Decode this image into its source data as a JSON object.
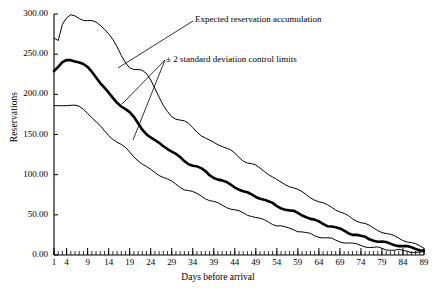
{
  "chart_data": {
    "type": "line",
    "title": "",
    "xlabel": "Days before arrival",
    "ylabel": "Reservations",
    "xlim": [
      1,
      89
    ],
    "ylim": [
      0,
      300
    ],
    "ytick_labels": [
      "0.00",
      "50.00",
      "100.00",
      "150.00",
      "200.00",
      "250.00",
      "300.00"
    ],
    "ytick_values": [
      0,
      50,
      100,
      150,
      200,
      250,
      300
    ],
    "xtick_labels": [
      "1",
      "4",
      "9",
      "14",
      "19",
      "24",
      "29",
      "34",
      "39",
      "44",
      "49",
      "54",
      "59",
      "64",
      "69",
      "74",
      "79",
      "84",
      "89"
    ],
    "xtick_values": [
      1,
      4,
      9,
      14,
      19,
      24,
      29,
      34,
      39,
      44,
      49,
      54,
      59,
      64,
      69,
      74,
      79,
      84,
      89
    ],
    "minor_xtick_interval": 1,
    "grid": false,
    "legend": "none",
    "line_color": "#000000",
    "background_color": "#ffffff",
    "annotations": [
      {
        "name": "expected-curve-label",
        "text": "Expected reservation accumulation"
      },
      {
        "name": "control-limits-label",
        "text": "± 2 standard deviation control limits"
      }
    ],
    "series": [
      {
        "name": "Upper control limit (+2 SD)",
        "style": "thin",
        "x": [
          1,
          2,
          3,
          4,
          5,
          6,
          7,
          8,
          9,
          10,
          11,
          12,
          13,
          14,
          15,
          16,
          17,
          18,
          19,
          20,
          21,
          22,
          23,
          24,
          25,
          26,
          27,
          28,
          29,
          30,
          31,
          32,
          33,
          34,
          35,
          36,
          37,
          38,
          39,
          40,
          41,
          42,
          43,
          44,
          45,
          46,
          47,
          48,
          49,
          50,
          51,
          52,
          53,
          54,
          55,
          56,
          57,
          58,
          59,
          60,
          61,
          62,
          63,
          64,
          65,
          66,
          67,
          68,
          69,
          70,
          71,
          72,
          73,
          74,
          75,
          76,
          77,
          78,
          79,
          80,
          81,
          82,
          83,
          84,
          85,
          86,
          87,
          88,
          89
        ],
        "y": [
          270,
          268,
          288,
          295,
          298,
          297,
          295,
          293,
          292,
          291,
          289,
          286,
          282,
          276,
          268,
          258,
          248,
          240,
          234,
          231,
          230,
          229,
          226,
          219,
          208,
          196,
          185,
          178,
          173,
          170,
          168,
          166,
          163,
          159,
          154,
          149,
          145,
          142,
          140,
          138,
          136,
          133,
          130,
          126,
          122,
          118,
          115,
          113,
          111,
          108,
          105,
          101,
          97,
          93,
          90,
          88,
          86,
          84,
          81,
          78,
          75,
          72,
          69,
          66,
          64,
          62,
          60,
          57,
          54,
          51,
          48,
          45,
          43,
          41,
          39,
          36,
          33,
          31,
          29,
          27,
          25,
          23,
          21,
          19,
          17,
          15,
          13,
          11,
          9
        ]
      },
      {
        "name": "Expected reservation accumulation",
        "style": "bold",
        "x": [
          1,
          2,
          3,
          4,
          5,
          6,
          7,
          8,
          9,
          10,
          11,
          12,
          13,
          14,
          15,
          16,
          17,
          18,
          19,
          20,
          21,
          22,
          23,
          24,
          25,
          26,
          27,
          28,
          29,
          30,
          31,
          32,
          33,
          34,
          35,
          36,
          37,
          38,
          39,
          40,
          41,
          42,
          43,
          44,
          45,
          46,
          47,
          48,
          49,
          50,
          51,
          52,
          53,
          54,
          55,
          56,
          57,
          58,
          59,
          60,
          61,
          62,
          63,
          64,
          65,
          66,
          67,
          68,
          69,
          70,
          71,
          72,
          73,
          74,
          75,
          76,
          77,
          78,
          79,
          80,
          81,
          82,
          83,
          84,
          85,
          86,
          87,
          88,
          89
        ],
        "y": [
          230,
          234,
          239,
          242,
          243,
          242,
          240,
          237,
          233,
          228,
          222,
          215,
          208,
          201,
          195,
          190,
          186,
          182,
          177,
          171,
          164,
          157,
          151,
          146,
          142,
          139,
          136,
          133,
          129,
          125,
          121,
          117,
          114,
          112,
          110,
          107,
          104,
          100,
          97,
          94,
          92,
          90,
          88,
          85,
          82,
          79,
          77,
          75,
          73,
          71,
          69,
          66,
          64,
          61,
          59,
          57,
          55,
          54,
          52,
          50,
          48,
          45,
          43,
          41,
          39,
          37,
          36,
          34,
          32,
          30,
          28,
          26,
          25,
          23,
          22,
          20,
          19,
          17,
          16,
          15,
          14,
          13,
          12,
          11,
          10,
          9,
          8,
          7,
          6
        ]
      },
      {
        "name": "Lower control limit (-2 SD)",
        "style": "thin",
        "x": [
          1,
          2,
          3,
          4,
          5,
          6,
          7,
          8,
          9,
          10,
          11,
          12,
          13,
          14,
          15,
          16,
          17,
          18,
          19,
          20,
          21,
          22,
          23,
          24,
          25,
          26,
          27,
          28,
          29,
          30,
          31,
          32,
          33,
          34,
          35,
          36,
          37,
          38,
          39,
          40,
          41,
          42,
          43,
          44,
          45,
          46,
          47,
          48,
          49,
          50,
          51,
          52,
          53,
          54,
          55,
          56,
          57,
          58,
          59,
          60,
          61,
          62,
          63,
          64,
          65,
          66,
          67,
          68,
          69,
          70,
          71,
          72,
          73,
          74,
          75,
          76,
          77,
          78,
          79,
          80,
          81,
          82,
          83,
          84,
          85,
          86,
          87,
          88,
          89
        ],
        "y": [
          185,
          185,
          186,
          187,
          187,
          186,
          184,
          181,
          177,
          172,
          166,
          160,
          154,
          149,
          145,
          141,
          137,
          133,
          128,
          123,
          118,
          113,
          109,
          106,
          103,
          100,
          97,
          94,
          91,
          88,
          85,
          82,
          80,
          78,
          76,
          74,
          71,
          68,
          66,
          64,
          62,
          60,
          58,
          56,
          54,
          52,
          50,
          49,
          47,
          45,
          43,
          41,
          39,
          37,
          36,
          34,
          33,
          32,
          30,
          29,
          27,
          26,
          24,
          23,
          22,
          21,
          20,
          18,
          17,
          16,
          15,
          14,
          13,
          12,
          11,
          10,
          9,
          9,
          8,
          7,
          7,
          6,
          6,
          5,
          5,
          4,
          4,
          3,
          3
        ]
      }
    ]
  }
}
